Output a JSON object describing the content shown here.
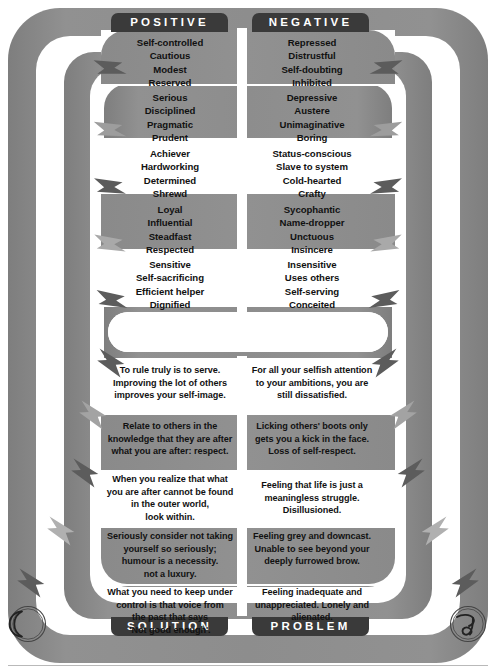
{
  "diagram": {
    "title_top_left": "POSITIVE",
    "title_top_right": "NEGATIVE",
    "title_bottom_left": "SOLUTION",
    "title_bottom_right": "PROBLEM",
    "colors": {
      "band_gray": "#8c8c8c",
      "band_white": "#ffffff",
      "tab_dark": "#3a3a3a",
      "arrow_dark": "#5a5a5a",
      "arrow_light": "#c9c9c9",
      "text": "#111111",
      "tab_text": "#ffffff"
    },
    "rows": [
      {
        "band": "gray",
        "positive": [
          "Self-controlled",
          "Cautious",
          "Modest",
          "Reserved"
        ],
        "negative": [
          "Repressed",
          "Distrustful",
          "Self-doubting",
          "Inhibited"
        ]
      },
      {
        "band": "white",
        "positive": [
          "Serious",
          "Disciplined",
          "Pragmatic",
          "Prudent"
        ],
        "negative": [
          "Depressive",
          "Austere",
          "Unimaginative",
          "Boring"
        ]
      },
      {
        "band": "gray",
        "positive": [
          "Achiever",
          "Hardworking",
          "Determined",
          "Shrewd"
        ],
        "negative": [
          "Status-conscious",
          "Slave to system",
          "Cold-hearted",
          "Crafty"
        ]
      },
      {
        "band": "white",
        "positive": [
          "Loyal",
          "Influential",
          "Steadfast",
          "Respected"
        ],
        "negative": [
          "Sycophantic",
          "Name-dropper",
          "Unctuous",
          "Insincere"
        ]
      },
      {
        "band": "gray",
        "positive": [
          "Sensitive",
          "Self-sacrificing",
          "Efficient helper",
          "Dignified"
        ],
        "negative": [
          "Insensitive",
          "Uses others",
          "Self-serving",
          "Conceited"
        ]
      }
    ],
    "rows_bottom": [
      {
        "band": "gray",
        "solution": [
          "To rule truly is to serve.",
          "Improving the lot of others",
          "improves your self-image."
        ],
        "problem": [
          "For all your selfish attention",
          "to your ambitions, you are",
          "still dissatisfied."
        ]
      },
      {
        "band": "white",
        "solution": [
          "Relate to others in the",
          "knowledge that they are after",
          "what you are after: respect."
        ],
        "problem": [
          "Licking others' boots only",
          "gets you a kick in the face.",
          "Loss of self-respect."
        ]
      },
      {
        "band": "gray",
        "solution": [
          "When you realize that what",
          "you are after cannot be found",
          "in the outer world,",
          "look within."
        ],
        "problem": [
          "Feeling that life is just a",
          "meaningless struggle.",
          "Disillusioned."
        ]
      },
      {
        "band": "white",
        "solution": [
          "Seriously consider not taking",
          "yourself so seriously;",
          "humour is a necessity.",
          "not a luxury."
        ],
        "problem": [
          "Feeling grey and downcast.",
          "Unable to see beyond your",
          "deeply furrowed brow."
        ]
      },
      {
        "band": "gray",
        "solution": [
          "What you need to keep under",
          "control is that voice from",
          "the past that says",
          "'Not good enough'."
        ],
        "problem": [
          "Feeling inadequate and",
          "unappreciated. Lonely and",
          "alienated."
        ]
      }
    ],
    "corner_glyphs": {
      "bottom_left": "crescent-moon-symbol",
      "bottom_right": "capricorn-symbol"
    }
  }
}
